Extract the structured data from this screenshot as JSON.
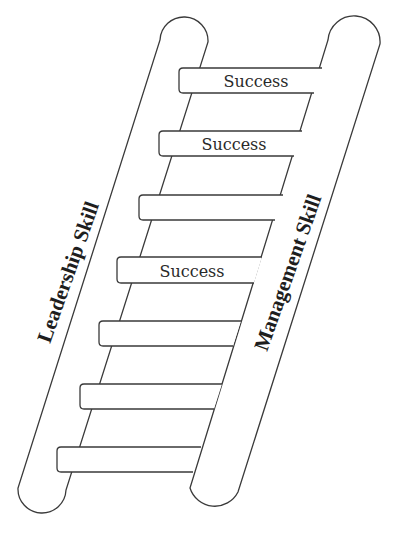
{
  "diagram": {
    "type": "ladder",
    "rails": {
      "left": {
        "label": "Leadership Skill"
      },
      "right": {
        "label": "Management Skill"
      }
    },
    "rungs": [
      {
        "index": 1,
        "label": "Success"
      },
      {
        "index": 2,
        "label": "Success"
      },
      {
        "index": 3,
        "label": ""
      },
      {
        "index": 4,
        "label": "Success"
      },
      {
        "index": 5,
        "label": ""
      },
      {
        "index": 6,
        "label": ""
      },
      {
        "index": 7,
        "label": ""
      }
    ]
  },
  "colors": {
    "stroke": "#3a3a3a",
    "fill": "#ffffff",
    "text": "#2a2a2a"
  }
}
